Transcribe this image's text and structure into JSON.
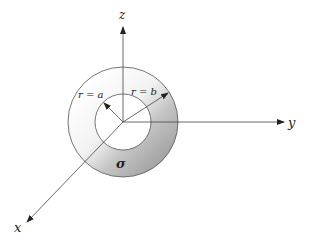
{
  "diagram": {
    "type": "annular-disk-3d-axes",
    "center": [
      123,
      122
    ],
    "outer_radius_px": 55,
    "inner_radius_px": 28,
    "axes": {
      "z": {
        "label": "z"
      },
      "y": {
        "label": "y"
      },
      "x": {
        "label": "x"
      }
    },
    "annotations": {
      "inner_radius": "r = a",
      "outer_radius": "r = b",
      "charge_density": "σ"
    },
    "colors": {
      "line": "#555555",
      "shade_light": "#ffffff",
      "shade_dark": "#a4a4a4"
    }
  }
}
